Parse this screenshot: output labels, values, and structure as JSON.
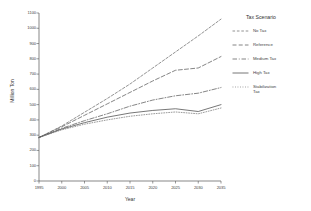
{
  "chart_data": {
    "type": "line",
    "title": "",
    "xlabel": "Year",
    "ylabel": "Million Ton",
    "xlim": [
      1995,
      2035
    ],
    "ylim": [
      0,
      1100
    ],
    "grid": false,
    "legend_position": "right",
    "legend_title": "Tax Scenario",
    "xticks": [
      "1995",
      "2000",
      "2005",
      "2010",
      "2015",
      "2020",
      "2025",
      "2030",
      "2035"
    ],
    "xtick_values": [
      1995,
      2000,
      2005,
      2010,
      2015,
      2020,
      2025,
      2030,
      2035
    ],
    "yticks": [
      "0",
      "100",
      "200",
      "300",
      "400",
      "500",
      "600",
      "700",
      "800",
      "900",
      "1000",
      "1100"
    ],
    "ytick_values": [
      0,
      100,
      200,
      300,
      400,
      500,
      600,
      700,
      800,
      900,
      1000,
      1100
    ],
    "x": [
      1995,
      2000,
      2005,
      2010,
      2015,
      2020,
      2025,
      2030,
      2035
    ],
    "series": [
      {
        "name": "No Tax",
        "style": "dashed-fine",
        "color": "#6f6f6f",
        "values": [
          285,
          360,
          450,
          540,
          635,
          740,
          845,
          950,
          1060
        ]
      },
      {
        "name": "Reference",
        "style": "dashed",
        "color": "#5c5c5c",
        "values": [
          285,
          355,
          430,
          505,
          580,
          655,
          725,
          740,
          815
        ]
      },
      {
        "name": "Medium Tax",
        "style": "dash-dot",
        "color": "#5c5c5c",
        "values": [
          285,
          345,
          395,
          440,
          490,
          530,
          558,
          575,
          612
        ]
      },
      {
        "name": "High Tax",
        "style": "solid",
        "color": "#4a4a4a",
        "values": [
          285,
          340,
          382,
          418,
          445,
          462,
          473,
          455,
          500
        ]
      },
      {
        "name": "Stabilization\nTax",
        "style": "dotted",
        "color": "#7a7a7a",
        "values": [
          285,
          335,
          372,
          400,
          424,
          440,
          452,
          440,
          478
        ]
      }
    ]
  }
}
